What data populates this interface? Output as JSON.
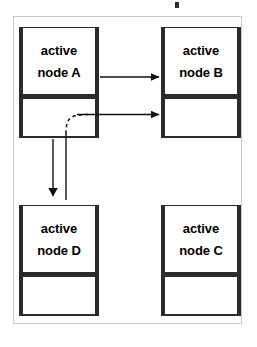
{
  "diagram": {
    "title_fragment": "",
    "frame": {
      "border_color": "#c9c9c9",
      "background": "#ffffff"
    },
    "ink_color": "#2b2b2b",
    "nodes": [
      {
        "id": "a",
        "line1": "active",
        "line2": "node A",
        "position": "top-left"
      },
      {
        "id": "b",
        "line1": "active",
        "line2": "node B",
        "position": "top-right"
      },
      {
        "id": "d",
        "line1": "active",
        "line2": "node D",
        "position": "bottom-left"
      },
      {
        "id": "c",
        "line1": "active",
        "line2": "node C",
        "position": "bottom-right"
      }
    ],
    "edges": [
      {
        "id": "a-upper-to-b-upper",
        "from": "node A",
        "to": "node B",
        "style": "solid",
        "arrowhead": true,
        "direction": "right"
      },
      {
        "id": "a-lower-to-b-lower",
        "from": "node A",
        "to": "node B",
        "style": "solid",
        "arrowhead": true,
        "direction": "right"
      },
      {
        "id": "a-lower-to-d",
        "from": "node A",
        "to": "node D",
        "style": "solid",
        "arrowhead": true,
        "direction": "down"
      },
      {
        "id": "rerouted-pointer",
        "from": "node D",
        "to": "node B",
        "style": "dashed-curve",
        "arrowhead": false,
        "direction": "up-right"
      }
    ]
  }
}
